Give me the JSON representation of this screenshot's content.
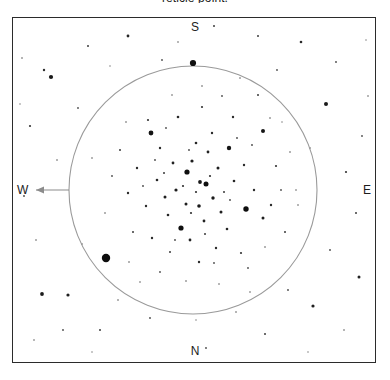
{
  "caption": {
    "text": "reticle point."
  },
  "frame": {
    "border_color": "#2b2b2b",
    "background": "#ffffff"
  },
  "cardinals": {
    "north": "N",
    "south": "S",
    "east": "E",
    "west": "W"
  },
  "fov_circle": {
    "label": "field-of-view-circle",
    "center_x": 193,
    "center_y": 190,
    "radius": 124,
    "color": "#9a9a9a",
    "stroke_width": 1.1
  },
  "direction_arrow": {
    "label": "west-direction-arrow",
    "from_x": 69,
    "from_y": 190,
    "to_x": 36,
    "to_y": 190,
    "color": "#8c8c8c"
  },
  "chart_data": {
    "type": "scatter",
    "title": "reticle point.",
    "xlabel": "",
    "ylabel": "",
    "xlim": [
      12,
      376
    ],
    "ylim": [
      17,
      363
    ],
    "grid": false,
    "legend": null,
    "orientation": {
      "top": "S",
      "bottom": "N",
      "left": "W",
      "right": "E"
    },
    "annotations": [
      {
        "name": "field-of-view-circle",
        "cx": 193,
        "cy": 190,
        "r": 124
      },
      {
        "name": "west-arrow",
        "x1": 69,
        "y1": 190,
        "x2": 36,
        "y2": 190
      }
    ],
    "series": [
      {
        "name": "cluster-core-stars",
        "points": [
          {
            "x": 193,
            "y": 63,
            "r": 3.1,
            "c": "#101010"
          },
          {
            "x": 106,
            "y": 258,
            "r": 4.2,
            "c": "#0d0d0d"
          },
          {
            "x": 151,
            "y": 133,
            "r": 2.4,
            "c": "#141414"
          },
          {
            "x": 229,
            "y": 148,
            "r": 2.2,
            "c": "#161616"
          },
          {
            "x": 263,
            "y": 131,
            "r": 2.0,
            "c": "#161616"
          },
          {
            "x": 187,
            "y": 172,
            "r": 2.6,
            "c": "#0f0f0f"
          },
          {
            "x": 206,
            "y": 184,
            "r": 2.5,
            "c": "#0f0f0f"
          },
          {
            "x": 181,
            "y": 228,
            "r": 2.6,
            "c": "#101010"
          },
          {
            "x": 246,
            "y": 209,
            "r": 2.7,
            "c": "#0e0e0e"
          },
          {
            "x": 200,
            "y": 182,
            "r": 1.9,
            "c": "#1a1a1a"
          },
          {
            "x": 192,
            "y": 161,
            "r": 1.6,
            "c": "#1d1d1d"
          },
          {
            "x": 176,
            "y": 190,
            "r": 1.6,
            "c": "#1d1d1d"
          },
          {
            "x": 213,
            "y": 198,
            "r": 1.7,
            "c": "#1b1b1b"
          },
          {
            "x": 199,
            "y": 206,
            "r": 1.8,
            "c": "#1a1a1a"
          },
          {
            "x": 218,
            "y": 168,
            "r": 1.5,
            "c": "#1f1f1f"
          },
          {
            "x": 165,
            "y": 197,
            "r": 1.5,
            "c": "#1f1f1f"
          },
          {
            "x": 208,
            "y": 152,
            "r": 1.4,
            "c": "#222222"
          },
          {
            "x": 186,
            "y": 204,
            "r": 1.5,
            "c": "#1f1f1f"
          },
          {
            "x": 221,
            "y": 212,
            "r": 1.5,
            "c": "#202020"
          },
          {
            "x": 173,
            "y": 163,
            "r": 1.4,
            "c": "#222222"
          },
          {
            "x": 204,
            "y": 221,
            "r": 1.4,
            "c": "#222222"
          },
          {
            "x": 157,
            "y": 180,
            "r": 1.3,
            "c": "#262626"
          },
          {
            "x": 234,
            "y": 181,
            "r": 1.3,
            "c": "#262626"
          },
          {
            "x": 196,
            "y": 143,
            "r": 1.3,
            "c": "#262626"
          },
          {
            "x": 190,
            "y": 240,
            "r": 1.4,
            "c": "#232323"
          },
          {
            "x": 168,
            "y": 215,
            "r": 1.3,
            "c": "#262626"
          },
          {
            "x": 227,
            "y": 229,
            "r": 1.3,
            "c": "#262626"
          },
          {
            "x": 146,
            "y": 206,
            "r": 1.2,
            "c": "#2b2b2b"
          },
          {
            "x": 244,
            "y": 165,
            "r": 1.2,
            "c": "#2b2b2b"
          },
          {
            "x": 212,
            "y": 133,
            "r": 1.2,
            "c": "#2b2b2b"
          },
          {
            "x": 160,
            "y": 148,
            "r": 1.2,
            "c": "#2b2b2b"
          },
          {
            "x": 178,
            "y": 117,
            "r": 1.3,
            "c": "#282828"
          },
          {
            "x": 233,
            "y": 117,
            "r": 1.2,
            "c": "#2c2c2c"
          },
          {
            "x": 137,
            "y": 168,
            "r": 1.2,
            "c": "#2c2c2c"
          },
          {
            "x": 254,
            "y": 190,
            "r": 1.2,
            "c": "#2c2c2c"
          },
          {
            "x": 216,
            "y": 248,
            "r": 1.2,
            "c": "#2c2c2c"
          },
          {
            "x": 152,
            "y": 238,
            "r": 1.2,
            "c": "#2c2c2c"
          },
          {
            "x": 199,
            "y": 262,
            "r": 1.2,
            "c": "#2c2c2c"
          },
          {
            "x": 263,
            "y": 218,
            "r": 1.5,
            "c": "#1f1f1f"
          },
          {
            "x": 271,
            "y": 205,
            "r": 1.2,
            "c": "#2c2c2c"
          },
          {
            "x": 128,
            "y": 193,
            "r": 1.2,
            "c": "#2c2c2c"
          },
          {
            "x": 276,
            "y": 166,
            "r": 1.1,
            "c": "#333333"
          },
          {
            "x": 202,
            "y": 107,
            "r": 1.1,
            "c": "#333333"
          },
          {
            "x": 241,
            "y": 253,
            "r": 1.1,
            "c": "#333333"
          },
          {
            "x": 148,
            "y": 120,
            "r": 1.1,
            "c": "#333333"
          },
          {
            "x": 120,
            "y": 150,
            "r": 1.0,
            "c": "#3a3a3a"
          },
          {
            "x": 170,
            "y": 252,
            "r": 1.0,
            "c": "#3a3a3a"
          },
          {
            "x": 285,
            "y": 232,
            "r": 1.0,
            "c": "#3a3a3a"
          },
          {
            "x": 133,
            "y": 232,
            "r": 1.0,
            "c": "#3a3a3a"
          },
          {
            "x": 258,
            "y": 95,
            "r": 1.0,
            "c": "#3a3a3a"
          },
          {
            "x": 196,
            "y": 192,
            "r": 1.1,
            "c": "#303030"
          },
          {
            "x": 183,
            "y": 186,
            "r": 1.1,
            "c": "#303030"
          },
          {
            "x": 210,
            "y": 176,
            "r": 1.1,
            "c": "#303030"
          },
          {
            "x": 191,
            "y": 213,
            "r": 1.1,
            "c": "#303030"
          },
          {
            "x": 224,
            "y": 192,
            "r": 1.0,
            "c": "#383838"
          },
          {
            "x": 164,
            "y": 173,
            "r": 1.0,
            "c": "#383838"
          },
          {
            "x": 205,
            "y": 234,
            "r": 1.0,
            "c": "#383838"
          },
          {
            "x": 237,
            "y": 138,
            "r": 0.9,
            "c": "#454545"
          },
          {
            "x": 155,
            "y": 160,
            "r": 0.9,
            "c": "#454545"
          },
          {
            "x": 189,
            "y": 150,
            "r": 0.9,
            "c": "#454545"
          },
          {
            "x": 230,
            "y": 200,
            "r": 0.9,
            "c": "#454545"
          },
          {
            "x": 175,
            "y": 240,
            "r": 0.9,
            "c": "#454545"
          },
          {
            "x": 143,
            "y": 186,
            "r": 0.9,
            "c": "#454545"
          },
          {
            "x": 252,
            "y": 145,
            "r": 0.9,
            "c": "#454545"
          },
          {
            "x": 214,
            "y": 263,
            "r": 0.9,
            "c": "#4b4b4b"
          },
          {
            "x": 166,
            "y": 128,
            "r": 0.9,
            "c": "#4b4b4b"
          },
          {
            "x": 281,
            "y": 190,
            "r": 0.9,
            "c": "#4b4b4b"
          },
          {
            "x": 112,
            "y": 176,
            "r": 0.9,
            "c": "#4b4b4b"
          },
          {
            "x": 222,
            "y": 96,
            "r": 0.9,
            "c": "#4b4b4b"
          },
          {
            "x": 160,
            "y": 272,
            "r": 0.9,
            "c": "#4b4b4b"
          },
          {
            "x": 248,
            "y": 268,
            "r": 0.9,
            "c": "#4b4b4b"
          },
          {
            "x": 126,
            "y": 122,
            "r": 0.8,
            "c": "#555555"
          },
          {
            "x": 270,
            "y": 118,
            "r": 0.8,
            "c": "#555555"
          },
          {
            "x": 105,
            "y": 213,
            "r": 0.8,
            "c": "#555555"
          },
          {
            "x": 290,
            "y": 152,
            "r": 0.8,
            "c": "#555555"
          },
          {
            "x": 186,
            "y": 281,
            "r": 0.8,
            "c": "#555555"
          },
          {
            "x": 129,
            "y": 262,
            "r": 0.8,
            "c": "#555555"
          },
          {
            "x": 265,
            "y": 247,
            "r": 0.8,
            "c": "#555555"
          },
          {
            "x": 202,
            "y": 86,
            "r": 0.8,
            "c": "#555555"
          },
          {
            "x": 172,
            "y": 95,
            "r": 0.8,
            "c": "#5b5b5b"
          },
          {
            "x": 240,
            "y": 78,
            "r": 0.8,
            "c": "#5b5b5b"
          },
          {
            "x": 298,
            "y": 205,
            "r": 0.8,
            "c": "#5b5b5b"
          },
          {
            "x": 92,
            "y": 158,
            "r": 0.8,
            "c": "#5b5b5b"
          },
          {
            "x": 219,
            "y": 284,
            "r": 0.8,
            "c": "#5b5b5b"
          }
        ]
      },
      {
        "name": "field-stars",
        "points": [
          {
            "x": 51,
            "y": 77,
            "r": 2.1,
            "c": "#181818"
          },
          {
            "x": 326,
            "y": 104,
            "r": 2.0,
            "c": "#1a1a1a"
          },
          {
            "x": 42,
            "y": 294,
            "r": 1.9,
            "c": "#1c1c1c"
          },
          {
            "x": 68,
            "y": 295,
            "r": 1.6,
            "c": "#202020"
          },
          {
            "x": 313,
            "y": 306,
            "r": 1.6,
            "c": "#202020"
          },
          {
            "x": 359,
            "y": 277,
            "r": 1.5,
            "c": "#232323"
          },
          {
            "x": 128,
            "y": 36,
            "r": 1.4,
            "c": "#262626"
          },
          {
            "x": 301,
            "y": 42,
            "r": 1.3,
            "c": "#2a2a2a"
          },
          {
            "x": 44,
            "y": 70,
            "r": 1.2,
            "c": "#2e2e2e"
          },
          {
            "x": 30,
            "y": 126,
            "r": 1.1,
            "c": "#343434"
          },
          {
            "x": 346,
            "y": 172,
            "r": 1.1,
            "c": "#343434"
          },
          {
            "x": 356,
            "y": 213,
            "r": 1.0,
            "c": "#3c3c3c"
          },
          {
            "x": 88,
            "y": 46,
            "r": 1.0,
            "c": "#3c3c3c"
          },
          {
            "x": 258,
            "y": 36,
            "r": 1.0,
            "c": "#3c3c3c"
          },
          {
            "x": 214,
            "y": 26,
            "r": 1.0,
            "c": "#3c3c3c"
          },
          {
            "x": 100,
            "y": 330,
            "r": 1.0,
            "c": "#3c3c3c"
          },
          {
            "x": 265,
            "y": 334,
            "r": 1.0,
            "c": "#3c3c3c"
          },
          {
            "x": 336,
            "y": 62,
            "r": 0.9,
            "c": "#474747"
          },
          {
            "x": 24,
            "y": 196,
            "r": 0.9,
            "c": "#474747"
          },
          {
            "x": 63,
            "y": 330,
            "r": 0.9,
            "c": "#474747"
          },
          {
            "x": 150,
            "y": 318,
            "r": 0.9,
            "c": "#474747"
          },
          {
            "x": 206,
            "y": 348,
            "r": 0.9,
            "c": "#474747"
          },
          {
            "x": 330,
            "y": 250,
            "r": 0.9,
            "c": "#474747"
          },
          {
            "x": 288,
            "y": 290,
            "r": 0.9,
            "c": "#474747"
          },
          {
            "x": 78,
            "y": 108,
            "r": 0.9,
            "c": "#4d4d4d"
          },
          {
            "x": 162,
            "y": 60,
            "r": 0.9,
            "c": "#4d4d4d"
          },
          {
            "x": 277,
            "y": 70,
            "r": 0.9,
            "c": "#4d4d4d"
          },
          {
            "x": 362,
            "y": 136,
            "r": 0.9,
            "c": "#4d4d4d"
          },
          {
            "x": 36,
            "y": 240,
            "r": 0.8,
            "c": "#585858"
          },
          {
            "x": 57,
            "y": 160,
            "r": 0.8,
            "c": "#585858"
          },
          {
            "x": 118,
            "y": 300,
            "r": 0.8,
            "c": "#585858"
          },
          {
            "x": 236,
            "y": 312,
            "r": 0.8,
            "c": "#585858"
          },
          {
            "x": 344,
            "y": 330,
            "r": 0.8,
            "c": "#585858"
          },
          {
            "x": 22,
            "y": 58,
            "r": 0.8,
            "c": "#585858"
          },
          {
            "x": 310,
            "y": 148,
            "r": 0.8,
            "c": "#585858"
          },
          {
            "x": 82,
            "y": 244,
            "r": 0.8,
            "c": "#5e5e5e"
          },
          {
            "x": 178,
            "y": 42,
            "r": 0.8,
            "c": "#5e5e5e"
          },
          {
            "x": 296,
            "y": 190,
            "r": 0.8,
            "c": "#5e5e5e"
          },
          {
            "x": 140,
            "y": 282,
            "r": 0.8,
            "c": "#5e5e5e"
          },
          {
            "x": 250,
            "y": 292,
            "r": 0.8,
            "c": "#5e5e5e"
          },
          {
            "x": 368,
            "y": 96,
            "r": 0.8,
            "c": "#5e5e5e"
          },
          {
            "x": 34,
            "y": 340,
            "r": 0.8,
            "c": "#5e5e5e"
          },
          {
            "x": 92,
            "y": 352,
            "r": 0.7,
            "c": "#6a6a6a"
          },
          {
            "x": 308,
            "y": 352,
            "r": 0.7,
            "c": "#6a6a6a"
          },
          {
            "x": 366,
            "y": 40,
            "r": 0.7,
            "c": "#6a6a6a"
          },
          {
            "x": 20,
            "y": 104,
            "r": 0.7,
            "c": "#6a6a6a"
          },
          {
            "x": 196,
            "y": 320,
            "r": 0.7,
            "c": "#6a6a6a"
          },
          {
            "x": 110,
            "y": 66,
            "r": 0.7,
            "c": "#6a6a6a"
          },
          {
            "x": 282,
            "y": 122,
            "r": 0.7,
            "c": "#6a6a6a"
          }
        ]
      }
    ]
  }
}
